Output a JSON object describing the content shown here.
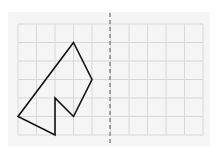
{
  "paper": {
    "x": 8,
    "y": 12,
    "width": 202,
    "height": 134,
    "color": "#f5f5f5"
  },
  "grid": {
    "origin_x": 18,
    "origin_y": 24,
    "cell": 18.5,
    "cols": 10,
    "rows": 6,
    "line_color": "#d8d8d8"
  },
  "mirror_line": {
    "x": 110,
    "y1": 13,
    "y2": 146,
    "color": "#888888",
    "dash": "4,3"
  },
  "shape": {
    "vertices": [
      [
        3,
        1
      ],
      [
        4,
        3
      ],
      [
        3,
        5
      ],
      [
        2,
        4
      ],
      [
        2,
        6
      ],
      [
        0,
        5
      ]
    ],
    "stroke": "#111111",
    "stroke_width": 1.6
  }
}
